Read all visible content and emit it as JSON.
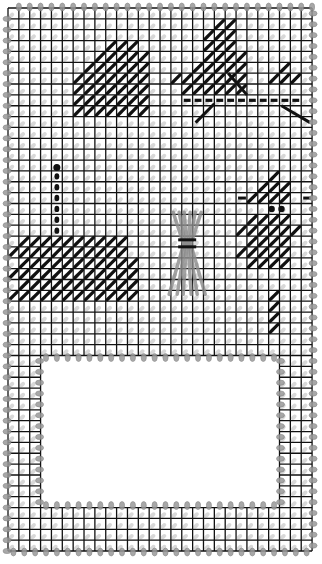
{
  "colors": {
    "grid": "#111111",
    "background": "#ffffff",
    "stitch_dark": "#111111",
    "stitch_light": "#b8b8b8",
    "overcast": "#9a9a9a",
    "wheat": "#8c8c8c"
  },
  "canvas": {
    "columns": 28,
    "rows": 50,
    "cutout": {
      "col_start": 3,
      "col_end": 25,
      "row_start": 32,
      "row_end": 46
    }
  },
  "motifs": [
    {
      "name": "ghost-motif",
      "stitch": "dark"
    },
    {
      "name": "witch-motif",
      "stitch": "dark"
    },
    {
      "name": "candle-motif",
      "stitch": "dark"
    },
    {
      "name": "pumpkin-base-motif",
      "stitch": "dark"
    },
    {
      "name": "wheat-sheaf-motif",
      "stitch": "gray"
    },
    {
      "name": "owl-motif",
      "stitch": "dark"
    }
  ]
}
